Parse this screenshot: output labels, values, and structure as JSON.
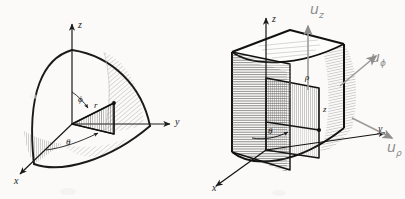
{
  "page": {
    "background_color": "#fbfaf8",
    "ink_color": "#1a1a1a",
    "pencil_color": "#8d8d8d",
    "width": 405,
    "height": 199
  },
  "figures": [
    {
      "id": "spherical-coordinates-figure",
      "name": "spherical-coordinate-octant",
      "description": "Octant of a sphere showing spherical coordinate differential element",
      "axes": [
        {
          "name": "z-axis",
          "label": "z"
        },
        {
          "name": "y-axis",
          "label": "y"
        },
        {
          "name": "x-axis",
          "label": "x"
        }
      ],
      "annotations": [
        {
          "name": "polar-angle-label",
          "label": "ϕ"
        },
        {
          "name": "radius-label",
          "label": "r"
        },
        {
          "name": "azimuth-angle-label",
          "label": "θ"
        }
      ]
    },
    {
      "id": "cylindrical-coordinates-figure",
      "name": "cylindrical-coordinate-wedge",
      "description": "Quarter cylinder wedge showing cylindrical coordinate element and unit vectors",
      "axes": [
        {
          "name": "z-axis",
          "label": "z"
        },
        {
          "name": "y-axis",
          "label": "y"
        },
        {
          "name": "x-axis",
          "label": "x"
        }
      ],
      "annotations": [
        {
          "name": "radial-distance-label",
          "label": "ρ"
        },
        {
          "name": "height-label",
          "label": "z"
        },
        {
          "name": "azimuth-angle-label",
          "label": "θ"
        }
      ],
      "unit_vectors": [
        {
          "name": "unit-vector-z",
          "base": "u",
          "sub": "z"
        },
        {
          "name": "unit-vector-phi",
          "base": "u",
          "sub": "ϕ"
        },
        {
          "name": "unit-vector-rho",
          "base": "u",
          "sub": "ρ"
        }
      ]
    }
  ]
}
